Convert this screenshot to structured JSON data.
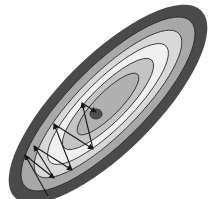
{
  "diagram": {
    "center": {
      "x": 108,
      "y": 104
    },
    "rotation_deg": -45,
    "contours": [
      {
        "rx": 132,
        "ry": 48,
        "fill": "#4a4a4a"
      },
      {
        "rx": 117,
        "ry": 38,
        "fill": "#a8a8a8"
      },
      {
        "rx": 100,
        "ry": 30,
        "fill": "#d8d8d8"
      },
      {
        "rx": 82,
        "ry": 24,
        "fill": "#f0f0f0"
      },
      {
        "rx": 62,
        "ry": 18,
        "fill": "#c4c4c4"
      },
      {
        "rx": 42,
        "ry": 12,
        "fill": "#b0b0b0"
      }
    ],
    "minimum": {
      "x": 96,
      "y": 114,
      "rx": 6,
      "ry": 5,
      "fill": "#505050"
    },
    "path_points": [
      [
        48,
        196
      ],
      [
        25,
        155
      ],
      [
        54,
        178
      ],
      [
        34,
        146
      ],
      [
        72,
        170
      ],
      [
        54,
        124
      ],
      [
        93,
        149
      ],
      [
        82,
        103
      ],
      [
        96,
        112
      ]
    ],
    "path_color": "#1a1a1a"
  }
}
